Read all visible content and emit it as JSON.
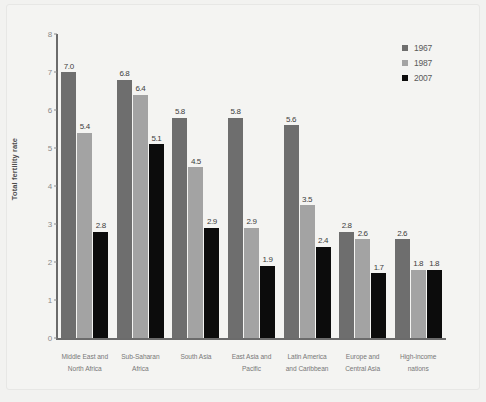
{
  "chart_data": {
    "type": "bar",
    "title": "",
    "subtitle": "",
    "xlabel": "",
    "ylabel": "Total fertility rate",
    "ylim": [
      0,
      8
    ],
    "yticks": [
      "0",
      "1",
      "2",
      "3",
      "4",
      "5",
      "6",
      "7",
      "8"
    ],
    "grid": false,
    "legend_position": "top-right",
    "categories": [
      "Middle East and\nNorth Africa",
      "Sub-Saharan\nAfrica",
      "South Asia",
      "East Asia and\nPacific",
      "Latin America\nand Caribbean",
      "Europe and\nCentral Asia",
      "High-income\nnations"
    ],
    "categories_lines": [
      [
        "Middle East and",
        "North Africa"
      ],
      [
        "Sub-Saharan",
        "Africa"
      ],
      [
        "South Asia",
        ""
      ],
      [
        "East Asia and",
        "Pacific"
      ],
      [
        "Latin America",
        "and Caribbean"
      ],
      [
        "Europe and",
        "Central Asia"
      ],
      [
        "High-income",
        "nations"
      ]
    ],
    "series": [
      {
        "name": "1967",
        "color": "#6e6e6e",
        "values": [
          7.0,
          6.8,
          5.8,
          5.8,
          5.6,
          2.8,
          2.6
        ],
        "labels": [
          "7.0",
          "6.8",
          "5.8",
          "5.8",
          "5.6",
          "2.8",
          "2.6"
        ]
      },
      {
        "name": "1987",
        "color": "#a3a3a3",
        "values": [
          5.4,
          6.4,
          4.5,
          2.9,
          3.5,
          2.6,
          1.8
        ],
        "labels": [
          "5.4",
          "6.4",
          "4.5",
          "2.9",
          "3.5",
          "2.6",
          "1.8"
        ]
      },
      {
        "name": "2007",
        "color": "#0c0c0c",
        "values": [
          2.8,
          5.1,
          2.9,
          1.9,
          2.4,
          1.7,
          1.8
        ],
        "labels": [
          "2.8",
          "5.1",
          "2.9",
          "1.9",
          "2.4",
          "1.7",
          "1.8"
        ]
      }
    ]
  },
  "legend": {
    "items": [
      {
        "label": "1967",
        "color": "#6e6e6e"
      },
      {
        "label": "1987",
        "color": "#a3a3a3"
      },
      {
        "label": "2007",
        "color": "#0c0c0c"
      }
    ]
  },
  "axis": {
    "y_label": "Total fertility rate",
    "y_ticks": [
      "8",
      "7",
      "6",
      "5",
      "4",
      "3",
      "2",
      "1",
      "0"
    ]
  }
}
